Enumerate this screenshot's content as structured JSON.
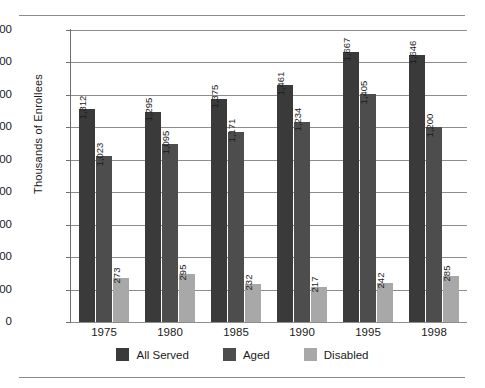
{
  "chart_data": {
    "type": "bar",
    "title": "",
    "xlabel": "",
    "ylabel": "Thousands of Enrollees",
    "categories": [
      "1975",
      "1980",
      "1985",
      "1990",
      "1995",
      "1998"
    ],
    "series": [
      {
        "name": "All Served",
        "color": "#3a3a3a",
        "values": [
          1312,
          1295,
          1375,
          1461,
          1667,
          1646
        ],
        "labels": [
          "1,312",
          "1,295",
          "1,375",
          "1,461",
          "1,667",
          "1,646"
        ]
      },
      {
        "name": "Aged",
        "color": "#4d4d4d",
        "values": [
          1023,
          1095,
          1171,
          1234,
          1405,
          1200
        ],
        "labels": [
          "1,023",
          "1,095",
          "1,171",
          "1,234",
          "1,405",
          "1,200"
        ]
      },
      {
        "name": "Disabled",
        "color": "#a8a8a8",
        "values": [
          273,
          295,
          232,
          217,
          242,
          285
        ],
        "labels": [
          "273",
          "295",
          "232",
          "217",
          "242",
          "285"
        ]
      }
    ],
    "ylim": [
      0,
      1800
    ],
    "yticks": [
      0,
      200,
      400,
      600,
      800,
      1000,
      1200,
      1400,
      1600,
      1800
    ],
    "ytick_labels": [
      "0",
      "200",
      "400",
      "600",
      "800",
      "1000",
      "1200",
      "1400",
      "1600",
      "1800"
    ],
    "grid": true,
    "legend_position": "bottom",
    "data_labels": true,
    "data_label_rotation": 90
  },
  "legend": {
    "items": [
      {
        "label": "All Served",
        "color": "#3a3a3a"
      },
      {
        "label": "Aged",
        "color": "#4d4d4d"
      },
      {
        "label": "Disabled",
        "color": "#a8a8a8"
      }
    ]
  }
}
